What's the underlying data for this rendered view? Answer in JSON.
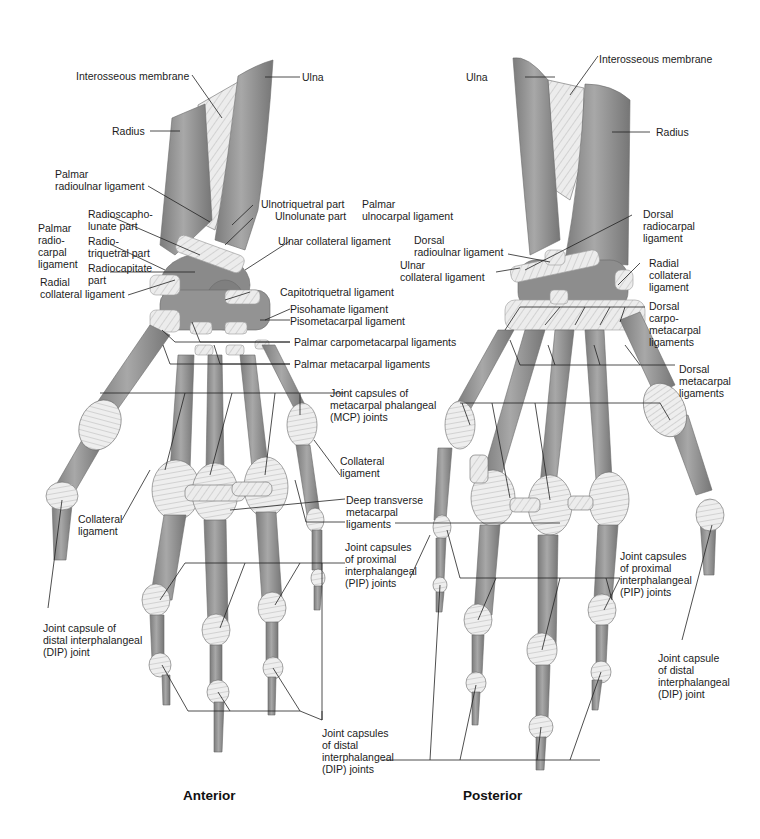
{
  "figure": {
    "views": [
      {
        "id": "anterior",
        "title": "Anterior"
      },
      {
        "id": "posterior",
        "title": "Posterior"
      }
    ],
    "colors": {
      "bone": "#8f8f8f",
      "bone_light": "#b4b4b4",
      "ligament": "#efefef",
      "leader_line": "#222222",
      "text": "#1c1c1c",
      "background": "#ffffff"
    }
  },
  "anterior": {
    "title": "Anterior",
    "labels": {
      "interosseous_membrane": "Interosseous membrane",
      "ulna": "Ulna",
      "radius": "Radius",
      "palmar_radioulnar": "Palmar\nradioulnar ligament",
      "ulnotriquetral_part": "Ulnotriquetral part",
      "ulnolunate_part": "Ulnolunate part",
      "palmar_ulnocarpal": "Palmar\nulnocarpal ligament",
      "palmar_radiocarpal": "Palmar\nradio-\ncarpal\nligament",
      "radioscapholunate_part": "Radioscapho-\nlunate part",
      "radiotriquetral_part": "Radio-\ntriquetral part",
      "radiocapitate_part": "Radiocapitate\npart",
      "ulnar_collateral": "Ulnar collateral ligament",
      "radial_collateral": "Radial\ncollateral ligament",
      "capitotriquetral": "Capitotriquetral ligament",
      "pisohamate": "Pisohamate ligament",
      "pisometacarpal": "Pisometacarpal ligament",
      "palmar_carpometacarpal": "Palmar carpometacarpal ligaments",
      "palmar_metacarpal": "Palmar metacarpal ligaments",
      "mcp_joints": "Joint capsules of\nmetacarpal phalangeal\n(MCP) joints",
      "collateral_ligament_right": "Collateral\nligament",
      "collateral_ligament_left": "Collateral\nligament",
      "deep_transverse": "Deep transverse\nmetacarpal\nligaments",
      "pip_joints": "Joint capsules\nof proximal\ninterphalangeal\n(PIP) joints",
      "dip_joint_single": "Joint capsule of\ndistal interphalangeal\n(DIP) joint",
      "dip_joints": "Joint capsules\nof distal\ninterphalangeal\n(DIP) joints"
    }
  },
  "posterior": {
    "title": "Posterior",
    "labels": {
      "ulna": "Ulna",
      "interosseous_membrane": "Interosseous membrane",
      "radius": "Radius",
      "dorsal_radiocarpal": "Dorsal\nradiocarpal\nligament",
      "dorsal_radioulnar": "Dorsal\nradioulnar ligament",
      "ulnar_collateral": "Ulnar\ncollateral ligament",
      "radial_collateral": "Radial\ncollateral\nligament",
      "dorsal_carpometacarpal": "Dorsal\ncarpo-\nmetacarpal\nligaments",
      "dorsal_metacarpal": "Dorsal\nmetacarpal\nligaments",
      "pip_joints": "Joint capsules\nof proximal\ninterphalangeal\n(PIP) joints",
      "dip_joint_single": "Joint capsule\nof distal\ninterphalangeal\n(DIP) joint"
    }
  }
}
